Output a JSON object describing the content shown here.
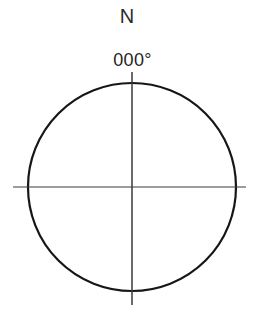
{
  "diagram": {
    "kind": "compass-rose",
    "background_color": "#ffffff",
    "labels": {
      "north": "N",
      "bearing": "000°"
    },
    "circle": {
      "center_x": 132,
      "center_y": 187,
      "radius": 104,
      "stroke_color": "#161616",
      "stroke_width": 2.2,
      "fill": "none"
    },
    "axes": {
      "stroke_color": "#3a3a3a",
      "vertical": {
        "name": "north-south-axis",
        "x": 132,
        "y_start": 72,
        "y_end": 305,
        "stroke_width": 1.5
      },
      "horizontal": {
        "name": "east-west-axis",
        "y": 187,
        "x_start": 13,
        "x_end": 246,
        "stroke_width": 1.2
      }
    }
  },
  "chart_data": {
    "type": "scatter",
    "subtitle": "",
    "xlabel": "",
    "ylabel": "",
    "grid": false,
    "legend_position": "none",
    "xlim": [
      -1.25,
      1.25
    ],
    "ylim": [
      -1.4,
      1.4
    ],
    "annotations": [
      {
        "text": "N",
        "x": 0,
        "y": 1.72,
        "role": "cardinal-direction-north"
      },
      {
        "text": "000°",
        "x": 0,
        "y": 1.3,
        "role": "bearing-value"
      }
    ],
    "shapes": [
      {
        "type": "circle",
        "cx": 0,
        "cy": 0,
        "r": 1,
        "fill": "none",
        "stroke": "#161616"
      },
      {
        "type": "line",
        "x0": 0,
        "y0": 1.11,
        "x1": 0,
        "y1": -1.13,
        "stroke": "#3a3a3a"
      },
      {
        "type": "line",
        "x0": -1.14,
        "y0": 0,
        "x1": 1.1,
        "y1": 0,
        "stroke": "#3a3a3a"
      }
    ]
  }
}
